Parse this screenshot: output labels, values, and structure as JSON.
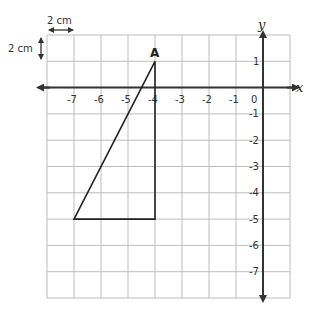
{
  "diagram": {
    "type": "coordinate-grid",
    "scale": {
      "horizontal_label": "2 cm",
      "vertical_label": "2 cm"
    },
    "axes": {
      "x_label": "x",
      "y_label": "y",
      "origin_label": "0",
      "x_ticks": [
        "-7",
        "-6",
        "-5",
        "-4",
        "-3",
        "-2",
        "-1"
      ],
      "y_ticks": [
        "1",
        "-1",
        "-2",
        "-3",
        "-4",
        "-5",
        "-6",
        "-7"
      ],
      "x_range": [
        -8,
        1
      ],
      "y_range": [
        -8,
        2
      ]
    },
    "shape": {
      "type": "triangle",
      "vertices": [
        [
          -4,
          1
        ],
        [
          -7,
          -5
        ],
        [
          -4,
          -5
        ]
      ],
      "labeled_vertex": {
        "label": "A",
        "coords": [
          -4,
          1
        ]
      }
    },
    "colors": {
      "grid": "#bdbdbd",
      "axes": "#333333",
      "shape": "#222222"
    }
  }
}
